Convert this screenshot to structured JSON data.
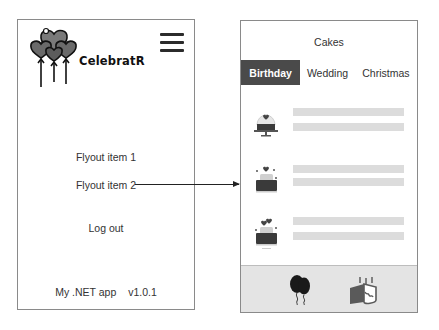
{
  "flyout": {
    "brand_name": "CelebratR",
    "logo_icon": "heart-balloons-icon",
    "menu_icon": "hamburger-menu-icon",
    "items": [
      {
        "label": "Flyout item 1"
      },
      {
        "label": "Flyout item 2"
      },
      {
        "label": "Log out"
      }
    ],
    "footer": {
      "app_name": "My .NET app",
      "version": "v1.0.1"
    }
  },
  "connector": {
    "from": "Flyout item 2",
    "to": "Cakes page",
    "type": "arrow"
  },
  "cakes_page": {
    "title": "Cakes",
    "tabs": [
      {
        "label": "Birthday",
        "active": true
      },
      {
        "label": "Wedding",
        "active": false
      },
      {
        "label": "Christmas",
        "active": false
      }
    ],
    "list_items": [
      {
        "icon": "cake-dome-icon",
        "placeholder_lines": 2
      },
      {
        "icon": "cake-heart-icon",
        "placeholder_lines": 2
      },
      {
        "icon": "cake-hearts-icon",
        "placeholder_lines": 2
      }
    ],
    "bottom_tabs": [
      {
        "icon": "balloons-icon"
      },
      {
        "icon": "birthday-cake-icon"
      }
    ]
  },
  "colors": {
    "active_tab": "#4a4a4a",
    "placeholder": "#dcdcdc",
    "tabbar": "#e4e4e4",
    "border": "#8a8a8a"
  }
}
